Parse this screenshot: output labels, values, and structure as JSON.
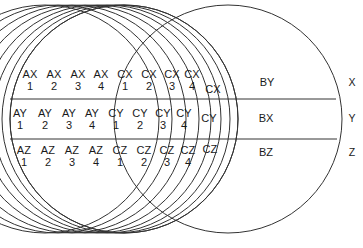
{
  "figure": {
    "type": "venn-diagram",
    "title": "",
    "background_color": "#ffffff",
    "stroke_color": "#333333",
    "text_color": "#1a1a1a"
  },
  "bands": [
    {
      "id": "x",
      "axis_label": "X",
      "outer_label": "BY"
    },
    {
      "id": "y",
      "axis_label": "Y",
      "outer_label": "BX"
    },
    {
      "id": "z",
      "axis_label": "Z",
      "outer_label": "BZ"
    }
  ],
  "cells": {
    "top_band": [
      {
        "prefix": "AX",
        "index": "1"
      },
      {
        "prefix": "AX",
        "index": "2"
      },
      {
        "prefix": "AX",
        "index": "3"
      },
      {
        "prefix": "AX",
        "index": "4"
      },
      {
        "prefix": "CX",
        "index": "1"
      },
      {
        "prefix": "CX",
        "index": "2"
      },
      {
        "prefix": "CX",
        "index": "3"
      },
      {
        "prefix": "CX",
        "index": "4"
      }
    ],
    "middle_band": [
      {
        "prefix": "AY",
        "index": "1"
      },
      {
        "prefix": "AY",
        "index": "2"
      },
      {
        "prefix": "AY",
        "index": "3"
      },
      {
        "prefix": "AY",
        "index": "4"
      },
      {
        "prefix": "CY",
        "index": "1"
      },
      {
        "prefix": "CY",
        "index": "2"
      },
      {
        "prefix": "CY",
        "index": "3"
      },
      {
        "prefix": "CY",
        "index": "4"
      }
    ],
    "bottom_band": [
      {
        "prefix": "AZ",
        "index": "1"
      },
      {
        "prefix": "AZ",
        "index": "2"
      },
      {
        "prefix": "AZ",
        "index": "3"
      },
      {
        "prefix": "AZ",
        "index": "4"
      },
      {
        "prefix": "CZ",
        "index": "1"
      },
      {
        "prefix": "CZ",
        "index": "2"
      },
      {
        "prefix": "CZ",
        "index": "3"
      },
      {
        "prefix": "CZ",
        "index": "4"
      }
    ]
  },
  "lens_cells": {
    "top": "CX",
    "middle": "CY",
    "bottom": "CZ"
  },
  "right_regions": {
    "top": "BY",
    "middle": "BX",
    "bottom": "BZ"
  },
  "axis_markers": {
    "top": "X",
    "middle": "Y",
    "bottom": "Z"
  }
}
